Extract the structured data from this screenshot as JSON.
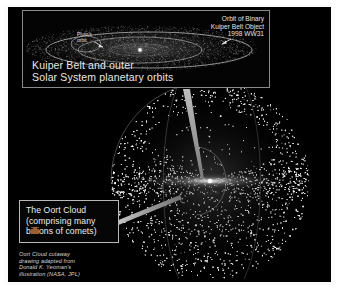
{
  "figure": {
    "background_color": "#000000",
    "frame_color": "#fbfbfb",
    "accent_color": "#e9e9e9"
  },
  "inset": {
    "name": "kuiper-belt-inset",
    "title": "Kuiper Belt and outer\nSolar System planetary orbits",
    "kbo_label": "Orbit of Binary\nKuiper Belt Object\n1998 WW31",
    "pluto_label": "Pluto's\norbit",
    "border_color": "#8a8a8a"
  },
  "oort_callout": {
    "name": "oort-cloud-callout",
    "text": "The Oort Cloud\n(comprising many\nbillions of comets)",
    "border_color": "#b9b9b9"
  },
  "credit": {
    "text": "Oort Cloud cutaway\ndrawing adapted from\nDonald K. Yeoman's\nillustration (NASA, JPL)"
  },
  "icons": {
    "pointer_wedge_inset": "pointer-wedge-icon",
    "pointer_wedge_oort": "pointer-wedge-icon",
    "kbo_arrow": "arrow-icon",
    "pluto_arrow": "arrow-icon",
    "sun_marker": "sun-dot-icon"
  }
}
